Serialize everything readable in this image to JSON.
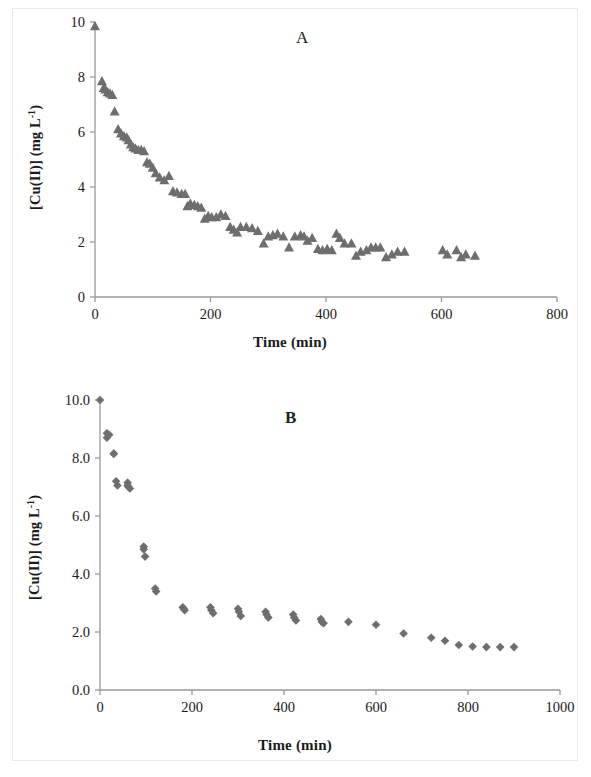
{
  "figure": {
    "background_color": "#ffffff",
    "frame_color": "#e9e9e9",
    "marker_color": "#6e6e6e",
    "axis_color": "#999999",
    "text_color": "#1a1a1a"
  },
  "panels": [
    {
      "letter": "A",
      "xlabel": "Time (min)",
      "ylabel_main": "[Cu(II)] (mg L",
      "ylabel_sup": "-1",
      "ylabel_tail": ")",
      "xticks": [
        "0",
        "200",
        "400",
        "600",
        "800"
      ],
      "yticks": [
        "0",
        "2",
        "4",
        "6",
        "8",
        "10"
      ]
    },
    {
      "letter": "B",
      "xlabel": "Time (min)",
      "ylabel_main": "[Cu(II)] (mg L",
      "ylabel_sup": "-1",
      "ylabel_tail": ")",
      "xticks": [
        "0",
        "200",
        "400",
        "600",
        "800",
        "1000"
      ],
      "yticks": [
        "0.0",
        "2.0",
        "4.0",
        "6.0",
        "8.0",
        "10.0"
      ]
    }
  ],
  "chart_data": [
    {
      "type": "scatter",
      "panel": "A",
      "title": "A",
      "xlabel": "Time (min)",
      "ylabel": "[Cu(II)] (mg L-1)",
      "xlim": [
        0,
        800
      ],
      "ylim": [
        0,
        10
      ],
      "xticks": [
        0,
        200,
        400,
        600,
        800
      ],
      "yticks": [
        0,
        2,
        4,
        6,
        8,
        10
      ],
      "grid": false,
      "legend": null,
      "marker": "triangle",
      "marker_color": "#6e6e6e",
      "series": [
        {
          "name": "[Cu(II)]",
          "x": [
            0,
            12,
            15,
            18,
            22,
            26,
            30,
            34,
            40,
            45,
            50,
            55,
            58,
            62,
            66,
            70,
            75,
            80,
            85,
            90,
            95,
            100,
            105,
            112,
            120,
            128,
            135,
            142,
            150,
            156,
            160,
            165,
            172,
            178,
            184,
            190,
            196,
            202,
            210,
            218,
            226,
            234,
            240,
            246,
            252,
            262,
            272,
            282,
            292,
            300,
            308,
            316,
            326,
            336,
            346,
            356,
            362,
            368,
            376,
            386,
            394,
            402,
            410,
            418,
            424,
            432,
            444,
            452,
            460,
            470,
            478,
            486,
            494,
            504,
            514,
            524,
            536,
            602,
            610,
            626,
            634,
            642,
            658
          ],
          "y": [
            9.85,
            7.85,
            7.6,
            7.55,
            7.45,
            7.4,
            7.35,
            6.75,
            6.1,
            5.95,
            5.85,
            5.8,
            5.7,
            5.55,
            5.45,
            5.4,
            5.35,
            5.35,
            5.3,
            4.9,
            4.85,
            4.7,
            4.5,
            4.35,
            4.25,
            4.4,
            3.85,
            3.8,
            3.75,
            3.75,
            3.3,
            3.4,
            3.35,
            3.3,
            3.25,
            2.85,
            2.95,
            2.9,
            2.9,
            3.0,
            2.95,
            2.55,
            2.45,
            2.35,
            2.55,
            2.55,
            2.5,
            2.4,
            1.95,
            2.2,
            2.25,
            2.3,
            2.2,
            1.8,
            2.2,
            2.25,
            2.2,
            2.05,
            2.15,
            1.75,
            1.7,
            1.75,
            1.7,
            2.3,
            2.15,
            1.95,
            1.95,
            1.5,
            1.65,
            1.7,
            1.8,
            1.8,
            1.8,
            1.45,
            1.55,
            1.65,
            1.65,
            1.7,
            1.55,
            1.7,
            1.45,
            1.55,
            1.5
          ]
        }
      ]
    },
    {
      "type": "scatter",
      "panel": "B",
      "title": "B",
      "xlabel": "Time (min)",
      "ylabel": "[Cu(II)] (mg L-1)",
      "xlim": [
        0,
        1000
      ],
      "ylim": [
        0,
        10
      ],
      "xticks": [
        0,
        200,
        400,
        600,
        800,
        1000
      ],
      "yticks": [
        0.0,
        2.0,
        4.0,
        6.0,
        8.0,
        10.0
      ],
      "grid": false,
      "legend": null,
      "marker": "diamond",
      "marker_color": "#6e6e6e",
      "series": [
        {
          "name": "[Cu(II)]",
          "x": [
            0,
            15,
            15,
            20,
            30,
            30,
            35,
            38,
            60,
            60,
            62,
            65,
            95,
            95,
            98,
            120,
            122,
            180,
            182,
            184,
            240,
            242,
            246,
            300,
            302,
            306,
            360,
            362,
            366,
            420,
            422,
            426,
            480,
            482,
            486,
            540,
            600,
            660,
            720,
            750,
            780,
            810,
            840,
            870,
            900
          ],
          "y": [
            10.0,
            8.85,
            8.7,
            8.8,
            8.15,
            8.15,
            7.2,
            7.05,
            7.15,
            7.05,
            7.0,
            6.95,
            4.95,
            4.85,
            4.6,
            3.5,
            3.4,
            2.85,
            2.8,
            2.75,
            2.85,
            2.75,
            2.65,
            2.8,
            2.7,
            2.55,
            2.7,
            2.6,
            2.5,
            2.6,
            2.5,
            2.4,
            2.45,
            2.35,
            2.3,
            2.35,
            2.25,
            1.95,
            1.8,
            1.7,
            1.55,
            1.5,
            1.48,
            1.48,
            1.48
          ]
        }
      ]
    }
  ]
}
